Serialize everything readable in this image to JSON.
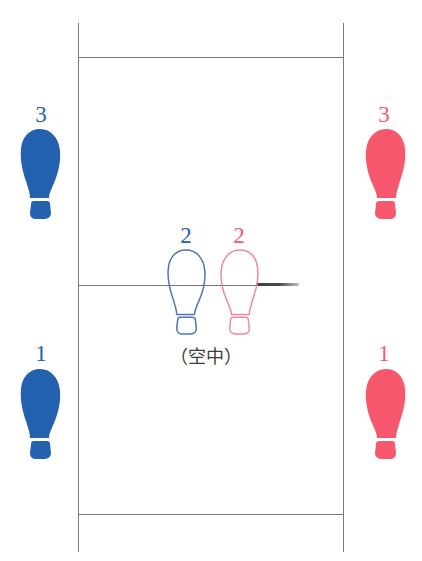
{
  "diagram": {
    "caption": "（空中）",
    "colors": {
      "blue": "#2461ae",
      "red": "#f8586d",
      "blue_outline": "#5274bc",
      "red_outline": "#f2899c",
      "line": "#76797c",
      "stub": "#3a3d40",
      "background": "#ffffff"
    },
    "court": {
      "left_line_x": 78,
      "right_line_x": 343,
      "top_line_y": 57,
      "middle_line_y": 285,
      "bottom_line_y": 514,
      "frame_top_y": 23,
      "frame_bottom_y": 552
    },
    "direction_marker": {
      "name": "direction-stub",
      "x": 256,
      "y": 284,
      "length": 43
    },
    "footprints": [
      {
        "id": "left-outer-step-3",
        "label": "3",
        "color": "blue",
        "style": "filled",
        "side": "left",
        "x": 18,
        "y": 128,
        "label_x": 28,
        "label_y": 103
      },
      {
        "id": "right-outer-step-3",
        "label": "3",
        "color": "red",
        "style": "filled",
        "side": "right",
        "x": 362,
        "y": 128,
        "label_x": 371,
        "label_y": 103
      },
      {
        "id": "center-left-step-2",
        "label": "2",
        "color": "blue",
        "style": "outline",
        "side": "left",
        "x": 164,
        "y": 249,
        "label_x": 173,
        "label_y": 224
      },
      {
        "id": "center-right-step-2",
        "label": "2",
        "color": "red",
        "style": "outline",
        "side": "right",
        "x": 216,
        "y": 249,
        "label_x": 226,
        "label_y": 224
      },
      {
        "id": "left-outer-step-1",
        "label": "1",
        "color": "blue",
        "style": "filled",
        "side": "left",
        "x": 18,
        "y": 368,
        "label_x": 28,
        "label_y": 342
      },
      {
        "id": "right-outer-step-1",
        "label": "1",
        "color": "red",
        "style": "filled",
        "side": "right",
        "x": 362,
        "y": 368,
        "label_x": 371,
        "label_y": 342
      }
    ],
    "labels": {
      "step1": "1",
      "step2": "2",
      "step3": "3"
    }
  }
}
